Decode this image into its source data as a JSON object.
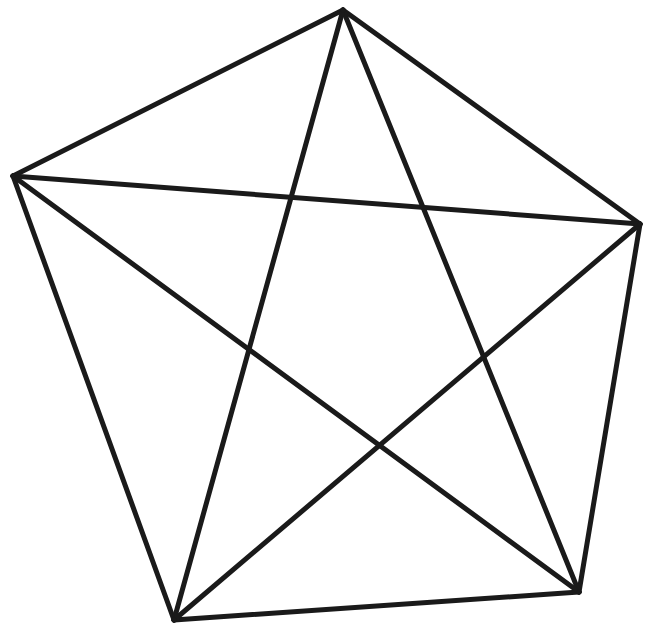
{
  "figure": {
    "width": 653,
    "height": 641,
    "background": "#ffffff",
    "stroke_color": "#1a1a1a",
    "stroke_width": 5,
    "vertices": [
      {
        "id": "A",
        "x": 343,
        "y": 10
      },
      {
        "id": "B",
        "x": 640,
        "y": 224
      },
      {
        "id": "C",
        "x": 579,
        "y": 592
      },
      {
        "id": "D",
        "x": 174,
        "y": 620
      },
      {
        "id": "E",
        "x": 13,
        "y": 176
      }
    ],
    "edges": [
      {
        "from": "A",
        "to": "B",
        "kind": "side"
      },
      {
        "from": "B",
        "to": "C",
        "kind": "side"
      },
      {
        "from": "C",
        "to": "D",
        "kind": "side"
      },
      {
        "from": "D",
        "to": "E",
        "kind": "side"
      },
      {
        "from": "E",
        "to": "A",
        "kind": "side"
      },
      {
        "from": "A",
        "to": "C",
        "kind": "diagonal"
      },
      {
        "from": "A",
        "to": "D",
        "kind": "diagonal"
      },
      {
        "from": "B",
        "to": "D",
        "kind": "diagonal"
      },
      {
        "from": "B",
        "to": "E",
        "kind": "diagonal"
      },
      {
        "from": "C",
        "to": "E",
        "kind": "diagonal"
      }
    ]
  }
}
